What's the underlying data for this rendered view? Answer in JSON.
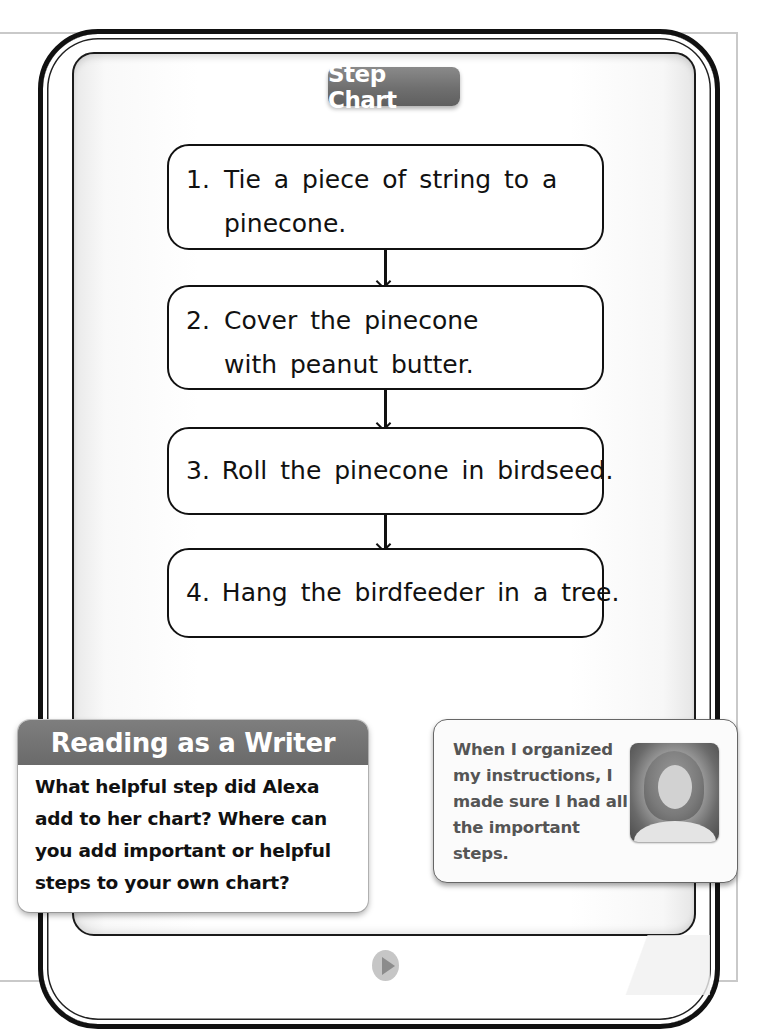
{
  "page": {
    "title": "Step Chart",
    "steps": [
      {
        "number": "1.",
        "text": "Tie a piece of string to a pinecone."
      },
      {
        "number": "2.",
        "text": "Cover the pinecone with peanut butter."
      },
      {
        "number": "3.",
        "text": "Roll the pinecone in birdseed."
      },
      {
        "number": "4.",
        "text": "Hang the birdfeeder in a tree."
      }
    ]
  },
  "reading_as_writer": {
    "heading": "Reading as a Writer",
    "body": "What helpful step did Alexa add to her chart?  Where can you add important or helpful steps to your own chart?"
  },
  "student_quote": {
    "text": "When I organized my instructions, I made sure I had all the important steps.",
    "photo_label": "student-photo"
  },
  "navigation": {
    "next_icon": "play-triangle-icon"
  },
  "colors": {
    "header_gray": "#6f6f6f",
    "frame_black": "#111111",
    "quote_text_gray": "#555555"
  }
}
